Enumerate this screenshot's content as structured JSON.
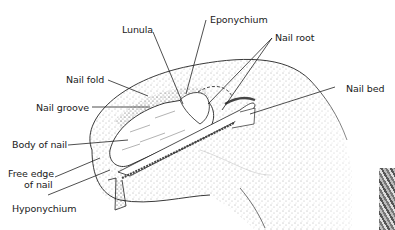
{
  "figure": {
    "labels": [
      {
        "id": "lunula",
        "text": "Lunula"
      },
      {
        "id": "eponychium",
        "text": "Eponychium"
      },
      {
        "id": "nail_root",
        "text": "Nail root"
      },
      {
        "id": "nail_fold",
        "text": "Nail fold"
      },
      {
        "id": "nail_bed",
        "text": "Nail bed"
      },
      {
        "id": "nail_groove",
        "text": "Nail groove"
      },
      {
        "id": "body_of_nail",
        "text": "Body of nail"
      },
      {
        "id": "free_edge_line1",
        "text": "Free edge"
      },
      {
        "id": "free_edge_line2",
        "text": "of nail"
      },
      {
        "id": "hyponychium",
        "text": "Hyponychium"
      }
    ]
  }
}
